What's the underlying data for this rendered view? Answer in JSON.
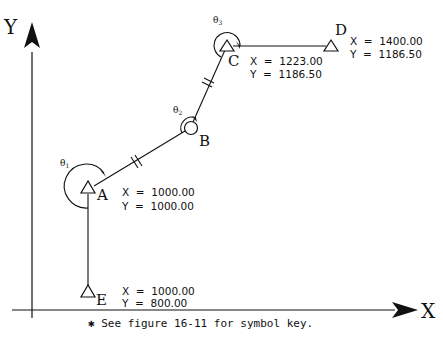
{
  "axes": {
    "x_label": "X",
    "y_label": "Y"
  },
  "stations": {
    "A": {
      "label": "A",
      "symbol": "triangle",
      "x_text": "X  =  1000.00",
      "y_text": "Y  =  1000.00"
    },
    "B": {
      "label": "B",
      "symbol": "circle"
    },
    "C": {
      "label": "C",
      "symbol": "triangle",
      "x_text": "X  =  1223.00",
      "y_text": "Y  =  1186.50"
    },
    "D": {
      "label": "D",
      "symbol": "triangle",
      "x_text": "X  =  1400.00",
      "y_text": "Y  =  1186.50"
    },
    "E": {
      "label": "E",
      "symbol": "triangle",
      "x_text": "X  =  1000.00",
      "y_text": "Y  =  800.00"
    }
  },
  "angles": {
    "theta1": {
      "symbol": "θ",
      "sub": "1"
    },
    "theta2": {
      "symbol": "θ",
      "sub": "2"
    },
    "theta3": {
      "symbol": "θ",
      "sub": "3"
    }
  },
  "footnote": "✱ See figure 16-11 for symbol key.",
  "colors": {
    "ink": "#111111",
    "background": "#ffffff"
  }
}
